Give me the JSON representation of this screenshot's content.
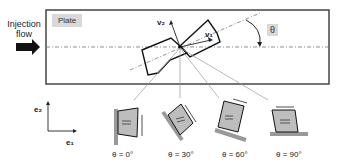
{
  "inflow": {
    "label_line1": "Injection",
    "label_line2": "flow"
  },
  "plate": {
    "label": "Plate"
  },
  "vectors": {
    "v1": "v₁",
    "v2": "v₂"
  },
  "angle": {
    "symbol": "θ"
  },
  "axes": {
    "e1": "e₁",
    "e2": "e₂"
  },
  "orientations": [
    {
      "caption": "θ = 0°"
    },
    {
      "caption": "θ = 30°"
    },
    {
      "caption": "θ = 60°"
    },
    {
      "caption": "θ = 90°"
    }
  ],
  "colors": {
    "fill": "#bdbdbd",
    "line": "#222222",
    "accent_bg": "#d9d9d9"
  }
}
